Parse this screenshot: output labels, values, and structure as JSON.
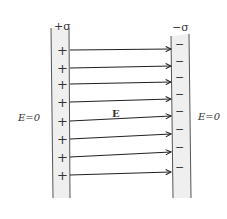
{
  "diagram": {
    "left_plate": {
      "charge_label": "+σ",
      "sign": "+",
      "count": 8,
      "fill": "#efefef",
      "stroke": "#555555"
    },
    "right_plate": {
      "charge_label": "−σ",
      "sign": "−",
      "count": 8,
      "fill": "#efefef",
      "stroke": "#555555"
    },
    "field_label": "E",
    "outside_left_label": "E=0",
    "outside_right_label": "E=0",
    "arrows": [
      {
        "y1": 50,
        "y2": 49
      },
      {
        "y1": 68,
        "y2": 66
      },
      {
        "y1": 84,
        "y2": 82
      },
      {
        "y1": 102,
        "y2": 99
      },
      {
        "y1": 121,
        "y2": 116
      },
      {
        "y1": 139,
        "y2": 134
      },
      {
        "y1": 157,
        "y2": 152
      },
      {
        "y1": 175,
        "y2": 172
      }
    ],
    "arrow_color": "#222222"
  }
}
